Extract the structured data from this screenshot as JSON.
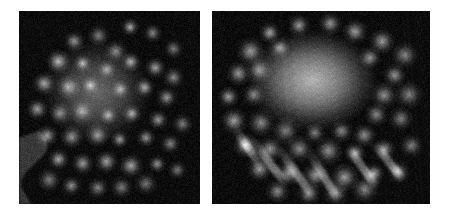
{
  "figure": {
    "background_color": "#ffffff",
    "width": 451,
    "height": 215,
    "caption": "",
    "panel_count": 2
  },
  "panels": [
    {
      "id": "panel-left",
      "label": "",
      "kind": "electron-micrograph",
      "modality": "grayscale",
      "bounds": {
        "x": 19,
        "y": 11,
        "width": 181,
        "height": 193
      },
      "background_color": "#0b0b0b",
      "spot_color": "#cfcfcf",
      "core_color": "#9a9a9a",
      "edge_band_color": "#6e6e6e",
      "description": "Dark field with quasi-ordered lattice of bright round spots; diffuse bright core upper-left of centre; mid-grey irregular band along lower-left edge.",
      "lattice": {
        "type": "quasi-square",
        "spacing_px": 19,
        "rotation_deg": -8,
        "spot_radius_px": 5.5
      },
      "core": {
        "cx": 0.43,
        "cy": 0.42,
        "rx": 0.3,
        "ry": 0.27,
        "intensity": 0.62
      },
      "edge_band": {
        "x": 0.0,
        "y": 0.62,
        "w": 0.14,
        "h": 0.38,
        "intensity": 0.42
      },
      "spots": [
        [
          0.62,
          0.09,
          0.8
        ],
        [
          0.74,
          0.12,
          0.62
        ],
        [
          0.85,
          0.2,
          0.55
        ],
        [
          0.31,
          0.16,
          0.72
        ],
        [
          0.44,
          0.13,
          0.6
        ],
        [
          0.53,
          0.21,
          0.58
        ],
        [
          0.22,
          0.26,
          0.86
        ],
        [
          0.35,
          0.27,
          0.7
        ],
        [
          0.48,
          0.3,
          0.55
        ],
        [
          0.62,
          0.26,
          0.78
        ],
        [
          0.75,
          0.29,
          0.74
        ],
        [
          0.86,
          0.34,
          0.62
        ],
        [
          0.14,
          0.37,
          0.8
        ],
        [
          0.27,
          0.4,
          0.62
        ],
        [
          0.4,
          0.39,
          0.58
        ],
        [
          0.56,
          0.41,
          0.6
        ],
        [
          0.69,
          0.4,
          0.76
        ],
        [
          0.82,
          0.45,
          0.7
        ],
        [
          0.1,
          0.51,
          0.74
        ],
        [
          0.22,
          0.53,
          0.6
        ],
        [
          0.35,
          0.52,
          0.56
        ],
        [
          0.49,
          0.54,
          0.62
        ],
        [
          0.63,
          0.53,
          0.74
        ],
        [
          0.77,
          0.56,
          0.72
        ],
        [
          0.9,
          0.58,
          0.58
        ],
        [
          0.16,
          0.64,
          0.76
        ],
        [
          0.29,
          0.66,
          0.7
        ],
        [
          0.43,
          0.65,
          0.68
        ],
        [
          0.56,
          0.67,
          0.74
        ],
        [
          0.7,
          0.66,
          0.72
        ],
        [
          0.83,
          0.69,
          0.62
        ],
        [
          0.22,
          0.77,
          0.8
        ],
        [
          0.35,
          0.79,
          0.74
        ],
        [
          0.49,
          0.78,
          0.76
        ],
        [
          0.62,
          0.8,
          0.78
        ],
        [
          0.76,
          0.79,
          0.7
        ],
        [
          0.88,
          0.82,
          0.56
        ],
        [
          0.29,
          0.9,
          0.66
        ],
        [
          0.43,
          0.91,
          0.62
        ],
        [
          0.57,
          0.92,
          0.58
        ],
        [
          0.7,
          0.9,
          0.54
        ],
        [
          0.16,
          0.88,
          0.58
        ]
      ]
    },
    {
      "id": "panel-right",
      "label": "",
      "kind": "electron-micrograph",
      "modality": "grayscale",
      "bounds": {
        "x": 212,
        "y": 11,
        "width": 218,
        "height": 193
      },
      "background_color": "#0b0b0b",
      "spot_color": "#d8d8d8",
      "core_color": "#c8c8c8",
      "edge_band_color": "#707070",
      "description": "Dark field with a large bright diffuse rounded core in the upper centre, ringed by bright spots; diagonal elongated streaks extend toward the lower-left and lower-right.",
      "lattice": {
        "type": "quasi-hexagonal",
        "spacing_px": 21,
        "rotation_deg": -22,
        "spot_radius_px": 6.5
      },
      "core": {
        "cx": 0.46,
        "cy": 0.36,
        "rx": 0.3,
        "ry": 0.26,
        "intensity": 0.86
      },
      "edge_band": {
        "x": 0.0,
        "y": 0.0,
        "w": 0.0,
        "h": 0.0,
        "intensity": 0.0
      },
      "spots": [
        [
          0.27,
          0.12,
          0.74
        ],
        [
          0.4,
          0.08,
          0.7
        ],
        [
          0.54,
          0.07,
          0.66
        ],
        [
          0.66,
          0.11,
          0.72
        ],
        [
          0.78,
          0.16,
          0.7
        ],
        [
          0.88,
          0.23,
          0.6
        ],
        [
          0.18,
          0.21,
          0.72
        ],
        [
          0.31,
          0.19,
          0.62
        ],
        [
          0.72,
          0.24,
          0.68
        ],
        [
          0.84,
          0.33,
          0.66
        ],
        [
          0.12,
          0.32,
          0.7
        ],
        [
          0.22,
          0.3,
          0.6
        ],
        [
          0.79,
          0.43,
          0.64
        ],
        [
          0.9,
          0.44,
          0.58
        ],
        [
          0.08,
          0.45,
          0.72
        ],
        [
          0.19,
          0.44,
          0.58
        ],
        [
          0.75,
          0.54,
          0.62
        ],
        [
          0.87,
          0.56,
          0.56
        ],
        [
          0.1,
          0.57,
          0.74
        ],
        [
          0.22,
          0.58,
          0.62
        ],
        [
          0.34,
          0.62,
          0.56
        ],
        [
          0.47,
          0.63,
          0.58
        ],
        [
          0.6,
          0.62,
          0.62
        ],
        [
          0.7,
          0.64,
          0.66
        ],
        [
          0.15,
          0.69,
          0.8
        ],
        [
          0.27,
          0.71,
          0.66
        ],
        [
          0.4,
          0.72,
          0.62
        ],
        [
          0.53,
          0.73,
          0.64
        ],
        [
          0.66,
          0.74,
          0.7
        ],
        [
          0.79,
          0.72,
          0.68
        ],
        [
          0.91,
          0.7,
          0.56
        ],
        [
          0.22,
          0.82,
          0.72
        ],
        [
          0.35,
          0.84,
          0.68
        ],
        [
          0.48,
          0.85,
          0.66
        ],
        [
          0.61,
          0.86,
          0.7
        ],
        [
          0.74,
          0.84,
          0.74
        ],
        [
          0.86,
          0.83,
          0.62
        ],
        [
          0.3,
          0.93,
          0.62
        ],
        [
          0.44,
          0.94,
          0.58
        ],
        [
          0.57,
          0.95,
          0.56
        ],
        [
          0.7,
          0.93,
          0.6
        ]
      ],
      "streaks": [
        [
          0.18,
          0.66,
          0.34,
          0.9,
          0.7
        ],
        [
          0.3,
          0.7,
          0.46,
          0.96,
          0.66
        ],
        [
          0.44,
          0.72,
          0.58,
          0.98,
          0.62
        ],
        [
          0.62,
          0.7,
          0.76,
          0.92,
          0.72
        ],
        [
          0.74,
          0.68,
          0.88,
          0.88,
          0.68
        ],
        [
          0.1,
          0.6,
          0.22,
          0.8,
          0.62
        ]
      ]
    }
  ]
}
